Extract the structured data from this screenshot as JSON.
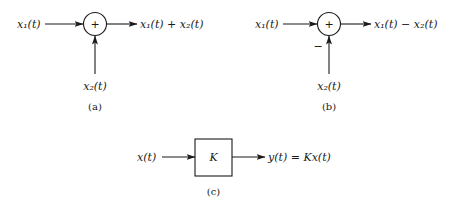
{
  "diagrams": {
    "a": {
      "input1": "x₁(t)",
      "input2": "x₂(t)",
      "junction_symbol": "+",
      "output": "x₁(t) + x₂(t)",
      "caption": "(a)"
    },
    "b": {
      "input1": "x₁(t)",
      "input2": "x₂(t)",
      "junction_symbol": "+",
      "input2_sign": "−",
      "output": "x₁(t) − x₂(t)",
      "caption": "(b)"
    },
    "c": {
      "input": "x(t)",
      "block_gain": "K",
      "output": "y(t) = Kx(t)",
      "caption": "(c)"
    }
  },
  "colors": {
    "ink": "#1a1a1a",
    "background": "#ffffff"
  }
}
